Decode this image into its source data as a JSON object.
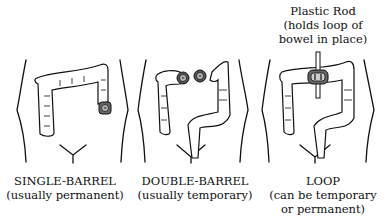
{
  "diagram": {
    "panels": [
      {
        "id": "single-barrel",
        "title": "SINGLE-BARREL",
        "subtitle": "(usually permanent)",
        "subtitle_line2": ""
      },
      {
        "id": "double-barrel",
        "title": "DOUBLE-BARREL",
        "subtitle": "(usually temporary)",
        "subtitle_line2": ""
      },
      {
        "id": "loop",
        "title": "LOOP",
        "subtitle": "(can be temporary",
        "subtitle_line2": "or permanent)"
      }
    ],
    "annotation": {
      "line1": "Plastic Rod",
      "line2": "(holds loop of",
      "line3": "bowel in place)"
    }
  }
}
